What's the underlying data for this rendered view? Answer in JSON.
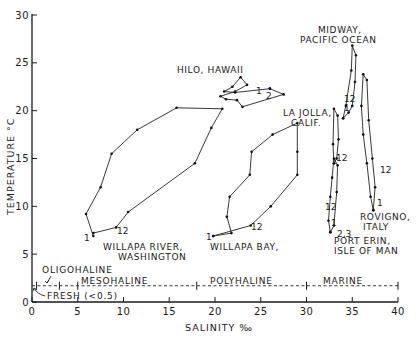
{
  "chart_data": {
    "type": "line",
    "title": "",
    "xlabel": "SALINITY ‰",
    "ylabel": "TEMPERATURE °C",
    "xlim": [
      0,
      40
    ],
    "ylim": [
      0,
      30
    ],
    "x_ticks": [
      0,
      5,
      10,
      15,
      20,
      25,
      30,
      35,
      40
    ],
    "y_ticks": [
      0,
      5,
      10,
      15,
      20,
      25,
      30
    ],
    "grid": false,
    "legend": "none (direct labels)",
    "series": [
      {
        "name": "WILLAPA RIVER, WASHINGTON",
        "start_label": "1",
        "end_label": "12",
        "points": [
          [
            6.7,
            6.9
          ],
          [
            5.9,
            9.2
          ],
          [
            7.5,
            12.0
          ],
          [
            8.7,
            15.5
          ],
          [
            11.5,
            18.0
          ],
          [
            15.8,
            20.3
          ],
          [
            20.8,
            20.2
          ],
          [
            19.6,
            18.2
          ],
          [
            17.8,
            14.5
          ],
          [
            10.5,
            9.4
          ],
          [
            9.2,
            7.8
          ],
          [
            6.7,
            7.2
          ]
        ]
      },
      {
        "name": "WILLAPA BAY,",
        "start_label": "1",
        "end_label": "12",
        "points": [
          [
            19.8,
            6.9
          ],
          [
            21.8,
            7.2
          ],
          [
            21.3,
            8.9
          ],
          [
            21.6,
            11.0
          ],
          [
            23.8,
            13.3
          ],
          [
            24.0,
            15.7
          ],
          [
            26.3,
            17.5
          ],
          [
            29.0,
            18.7
          ],
          [
            29.0,
            15.7
          ],
          [
            29.0,
            13.3
          ],
          [
            26.1,
            10.0
          ],
          [
            23.9,
            8.0
          ],
          [
            19.8,
            6.9
          ]
        ]
      },
      {
        "name": "HILO, HAWAII",
        "start_label": "1",
        "end_label": "2",
        "points": [
          [
            26.0,
            22.3
          ],
          [
            22.2,
            21.9
          ],
          [
            21.0,
            22.0
          ],
          [
            21.9,
            22.5
          ],
          [
            22.8,
            23.5
          ],
          [
            23.5,
            22.7
          ],
          [
            22.2,
            22.0
          ],
          [
            20.6,
            21.5
          ],
          [
            21.2,
            21.2
          ],
          [
            22.4,
            21.1
          ],
          [
            23.0,
            20.4
          ],
          [
            27.5,
            21.7
          ],
          [
            26.0,
            22.3
          ]
        ]
      },
      {
        "name": "MIDWAY, PACIFIC OCEAN",
        "start_label": "1",
        "end_label": "12",
        "points": [
          [
            34.0,
            19.2
          ],
          [
            34.3,
            20.5
          ],
          [
            34.9,
            24.2
          ],
          [
            35.0,
            26.8
          ],
          [
            35.4,
            25.8
          ],
          [
            35.3,
            23.0
          ],
          [
            35.0,
            20.5
          ],
          [
            34.6,
            19.8
          ],
          [
            34.0,
            19.2
          ]
        ]
      },
      {
        "name": "LA JOLLA, CALIF.",
        "start_label": "1",
        "end_label": "12",
        "points": [
          [
            33.0,
            14.5
          ],
          [
            32.9,
            16.5
          ],
          [
            33.0,
            20.2
          ],
          [
            33.4,
            19.5
          ],
          [
            33.5,
            17.0
          ],
          [
            33.3,
            15.0
          ],
          [
            33.0,
            14.5
          ]
        ]
      },
      {
        "name": "PORT ERIN, ISLE OF MAN",
        "start_label": "2,3",
        "end_label": "12",
        "points": [
          [
            32.6,
            7.3
          ],
          [
            32.4,
            8.5
          ],
          [
            32.6,
            11.0
          ],
          [
            32.8,
            13.0
          ],
          [
            33.0,
            15.0
          ],
          [
            33.4,
            14.3
          ],
          [
            33.3,
            11.5
          ],
          [
            33.0,
            8.0
          ],
          [
            32.6,
            7.3
          ]
        ]
      },
      {
        "name": "ROVIGNO, ITALY",
        "start_label": "1",
        "end_label": "12",
        "points": [
          [
            37.3,
            9.6
          ],
          [
            37.0,
            11.0
          ],
          [
            36.6,
            14.5
          ],
          [
            36.2,
            17.5
          ],
          [
            36.0,
            20.5
          ],
          [
            36.2,
            23.8
          ],
          [
            36.6,
            23.2
          ],
          [
            36.8,
            19.0
          ],
          [
            37.2,
            15.0
          ],
          [
            37.5,
            12.0
          ],
          [
            37.3,
            9.6
          ]
        ]
      }
    ],
    "salinity_zones": [
      {
        "name": "FRESH (<0.5)",
        "from": 0,
        "to": 0.5
      },
      {
        "name": "OLIGOHALINE",
        "from": 0.5,
        "to": 5
      },
      {
        "name": "MESOHALINE",
        "from": 5,
        "to": 18
      },
      {
        "name": "POLYHALINE",
        "from": 18,
        "to": 30
      },
      {
        "name": "MARINE",
        "from": 30,
        "to": 40
      }
    ],
    "zone_line_temperature": 1.7
  },
  "labels": {
    "ylabel": "TEMPERATURE °C",
    "xlabel": "SALINITY ‰",
    "sites": {
      "willapa_river_1": "WILLAPA  RIVER,",
      "willapa_river_2": "WASHINGTON",
      "willapa_bay": "WILLAPA  BAY,",
      "hilo": "HILO, HAWAII",
      "midway_1": "MIDWAY,",
      "midway_2": "PACIFIC OCEAN",
      "lajolla_1": "LA JOLLA,",
      "lajolla_2": "CALIF.",
      "porterin_1": "PORT ERIN,",
      "porterin_2": "ISLE OF MAN",
      "rovigno_1": "ROVIGNO,",
      "rovigno_2": "ITALY"
    },
    "months": {
      "wr_start": "1",
      "wr_end": "12",
      "wb_start": "1",
      "wb_end": "12",
      "hilo_start": "1",
      "hilo_end": "2",
      "midway_start": "1",
      "midway_end": "12",
      "lajolla_end": "12",
      "porterin_start": "1",
      "porterin_mid": "2,3",
      "porterin_end": "12",
      "rovigno_start": "1",
      "rovigno_end": "12"
    },
    "zones": {
      "oligohaline": "OLIGOHALINE",
      "mesohaline": "MESOHALINE",
      "polyhaline": "POLYHALINE",
      "marine": "MARINE",
      "fresh": "FRESH (<0.5)"
    },
    "xticks": [
      "0",
      "5",
      "10",
      "15",
      "20",
      "25",
      "30",
      "35",
      "40"
    ],
    "yticks": [
      "0",
      "5",
      "10",
      "15",
      "20",
      "25",
      "30"
    ]
  }
}
